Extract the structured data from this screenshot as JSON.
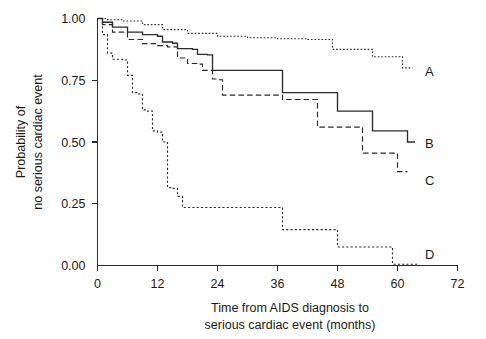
{
  "chart_data": {
    "type": "line",
    "subtype": "kaplan-meier-survival",
    "title": "",
    "xlabel": "Time from AIDS diagnosis to serious cardiac event (months)",
    "ylabel": "Probability of no serious cardiac event",
    "xlabel_line1": "Time from AIDS diagnosis to",
    "xlabel_line2": "serious cardiac event (months)",
    "ylabel_line1": "Probability of",
    "ylabel_line2": "no serious cardiac event",
    "xlim": [
      0,
      72
    ],
    "ylim": [
      0,
      1.0
    ],
    "xticks": [
      0,
      12,
      24,
      36,
      48,
      60,
      72
    ],
    "xtick_labels": [
      "0",
      "12",
      "24",
      "36",
      "48",
      "60",
      "72"
    ],
    "yticks": [
      0.0,
      0.25,
      0.5,
      0.75,
      1.0
    ],
    "ytick_labels": [
      "0.00",
      "0.25",
      "0.50",
      "0.75",
      "1.00"
    ],
    "grid": false,
    "legend_position": "inline-end-of-curve",
    "series": [
      {
        "name": "A",
        "label": "A",
        "style": "dotted",
        "color": "#2b2b2b",
        "label_x": 65.5,
        "label_y": 0.785,
        "points": [
          [
            0,
            1.0
          ],
          [
            2,
            0.995
          ],
          [
            5,
            0.99
          ],
          [
            9,
            0.975
          ],
          [
            13,
            0.955
          ],
          [
            18,
            0.94
          ],
          [
            24,
            0.928
          ],
          [
            30,
            0.922
          ],
          [
            36,
            0.918
          ],
          [
            42,
            0.915
          ],
          [
            47,
            0.912
          ],
          [
            47,
            0.875
          ],
          [
            55,
            0.872
          ],
          [
            55,
            0.845
          ],
          [
            61,
            0.843
          ],
          [
            61,
            0.8
          ],
          [
            63,
            0.8
          ]
        ]
      },
      {
        "name": "B",
        "label": "B",
        "style": "solid",
        "color": "#2b2b2b",
        "label_x": 65.5,
        "label_y": 0.495,
        "points": [
          [
            0,
            1.0
          ],
          [
            1,
            0.985
          ],
          [
            3,
            0.965
          ],
          [
            6,
            0.945
          ],
          [
            9,
            0.935
          ],
          [
            12,
            0.928
          ],
          [
            13,
            0.905
          ],
          [
            15,
            0.9
          ],
          [
            16,
            0.878
          ],
          [
            19,
            0.875
          ],
          [
            20,
            0.855
          ],
          [
            22,
            0.853
          ],
          [
            23,
            0.79
          ],
          [
            37,
            0.787
          ],
          [
            37,
            0.7
          ],
          [
            48,
            0.698
          ],
          [
            48,
            0.625
          ],
          [
            55,
            0.622
          ],
          [
            55,
            0.545
          ],
          [
            62,
            0.543
          ],
          [
            62,
            0.5
          ],
          [
            63.5,
            0.5
          ]
        ]
      },
      {
        "name": "C",
        "label": "C",
        "style": "dashed",
        "color": "#2b2b2b",
        "label_x": 65.5,
        "label_y": 0.345,
        "points": [
          [
            0,
            1.0
          ],
          [
            1,
            0.975
          ],
          [
            3,
            0.945
          ],
          [
            6,
            0.915
          ],
          [
            9,
            0.898
          ],
          [
            12,
            0.89
          ],
          [
            14,
            0.885
          ],
          [
            16,
            0.84
          ],
          [
            18,
            0.818
          ],
          [
            20,
            0.815
          ],
          [
            21,
            0.79
          ],
          [
            23,
            0.755
          ],
          [
            24,
            0.752
          ],
          [
            25,
            0.69
          ],
          [
            37,
            0.688
          ],
          [
            37,
            0.672
          ],
          [
            44,
            0.67
          ],
          [
            44,
            0.56
          ],
          [
            53,
            0.558
          ],
          [
            53,
            0.455
          ],
          [
            60,
            0.452
          ],
          [
            60,
            0.38
          ],
          [
            62,
            0.38
          ]
        ]
      },
      {
        "name": "D",
        "label": "D",
        "style": "fine-dotted",
        "color": "#2b2b2b",
        "label_x": 65.5,
        "label_y": 0.045,
        "points": [
          [
            0,
            1.0
          ],
          [
            1,
            0.935
          ],
          [
            2,
            0.86
          ],
          [
            3,
            0.835
          ],
          [
            5,
            0.832
          ],
          [
            6,
            0.77
          ],
          [
            7,
            0.7
          ],
          [
            8,
            0.695
          ],
          [
            9,
            0.63
          ],
          [
            10,
            0.625
          ],
          [
            11,
            0.545
          ],
          [
            12,
            0.54
          ],
          [
            13,
            0.5
          ],
          [
            14,
            0.315
          ],
          [
            15,
            0.312
          ],
          [
            16,
            0.28
          ],
          [
            17,
            0.235
          ],
          [
            37,
            0.232
          ],
          [
            37,
            0.145
          ],
          [
            48,
            0.142
          ],
          [
            48,
            0.075
          ],
          [
            59,
            0.073
          ],
          [
            59,
            0.005
          ],
          [
            64,
            0.005
          ]
        ]
      }
    ]
  }
}
